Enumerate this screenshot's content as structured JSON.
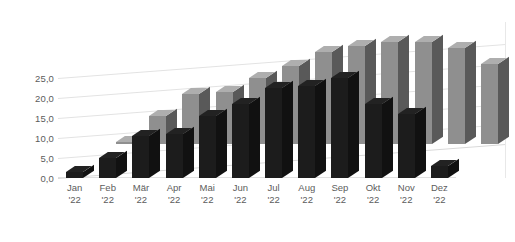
{
  "chart_data": {
    "type": "bar",
    "title": "",
    "xlabel": "",
    "ylabel": "",
    "ylim": [
      0,
      25
    ],
    "grid": true,
    "legend": "none",
    "projection": "3d-depth",
    "y_ticks": [
      "0,0",
      "5,0",
      "10,0",
      "15,0",
      "20,0",
      "25,0"
    ],
    "y_tick_values": [
      0,
      5,
      10,
      15,
      20,
      25
    ],
    "categories": [
      "Jan",
      "Feb",
      "Mär",
      "Apr",
      "Mai",
      "Jun",
      "Jul",
      "Aug",
      "Sep",
      "Okt",
      "Nov",
      "Dez"
    ],
    "category_sublabels": [
      "'22",
      "'22",
      "'22",
      "'22",
      "'22",
      "'22",
      "'22",
      "'22",
      "'22",
      "'22",
      "'22",
      "'22"
    ],
    "series": [
      {
        "name": "back",
        "color": "#8f8f8f",
        "values": [
          0.5,
          7.0,
          12.5,
          13.0,
          16.5,
          19.5,
          23.0,
          24.5,
          25.5,
          25.5,
          24.0,
          20.0
        ]
      },
      {
        "name": "front",
        "color": "#1c1c1c",
        "values": [
          1.5,
          5.0,
          10.5,
          11.0,
          15.5,
          18.5,
          22.5,
          23.0,
          25.0,
          18.5,
          16.0,
          3.0
        ]
      }
    ]
  },
  "style": {
    "background": "#ffffff",
    "gridline_color": "#e3e3e3",
    "axis_text_color": "#5c5c5c"
  }
}
